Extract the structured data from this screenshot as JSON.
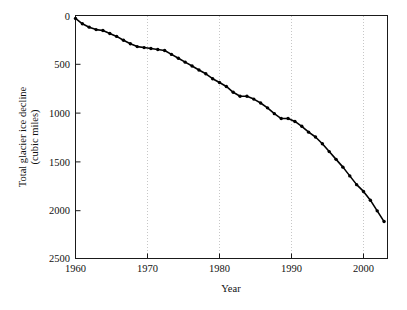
{
  "chart_data": {
    "type": "line",
    "title": "",
    "xlabel": "Year",
    "ylabel": "Total glacier ice decline (cubic miles)",
    "ylabel_line1": "Total glacier ice decline",
    "ylabel_line2": "(cubic miles)",
    "xlim": [
      1960,
      2005.5
    ],
    "ylim": [
      0,
      2500
    ],
    "y_inverted": true,
    "grid": "vertical-dotted",
    "legend": "none",
    "xticks": [
      1960,
      1970,
      1980,
      1990,
      2000
    ],
    "xticklabels": [
      "1960",
      "1970",
      "1980",
      "1990",
      "2000"
    ],
    "yticks": [
      0,
      500,
      1000,
      1500,
      2000,
      2500
    ],
    "yticklabels": [
      "0",
      "500",
      "1000",
      "1500",
      "2000",
      "2500"
    ],
    "series_name": "Total glacier ice decline",
    "marker": "filled-circle",
    "line_color": "#000000",
    "x": [
      1960,
      1961,
      1962,
      1963,
      1964,
      1965,
      1966,
      1967,
      1968,
      1969,
      1970,
      1971,
      1972,
      1973,
      1974,
      1975,
      1976,
      1977,
      1978,
      1979,
      1980,
      1981,
      1982,
      1983,
      1984,
      1985,
      1986,
      1987,
      1988,
      1989,
      1990,
      1991,
      1992,
      1993,
      1994,
      1995,
      1996,
      1997,
      1998,
      1999,
      2000,
      2001,
      2002,
      2003,
      2004,
      2005
    ],
    "values": [
      30,
      85,
      120,
      145,
      155,
      185,
      215,
      255,
      290,
      320,
      330,
      340,
      350,
      360,
      400,
      440,
      480,
      520,
      560,
      600,
      650,
      690,
      730,
      790,
      830,
      830,
      860,
      900,
      950,
      1010,
      1060,
      1060,
      1090,
      1140,
      1200,
      1250,
      1320,
      1400,
      1480,
      1560,
      1650,
      1740,
      1810,
      1900,
      2010,
      2120
    ]
  },
  "axes": {
    "x_tick_unit": "year",
    "y_tick_unit": "cubic miles"
  }
}
